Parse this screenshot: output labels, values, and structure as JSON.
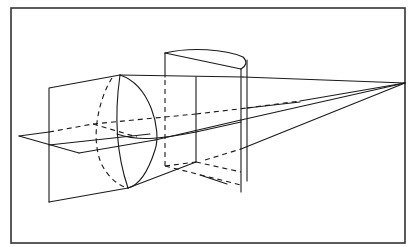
{
  "figure": {
    "colors": {
      "line": "#1a1a1a",
      "frame": "#333333",
      "background": "#ffffff"
    },
    "frame": {
      "x": 11,
      "y": 8,
      "width": 394,
      "height": 235
    },
    "vanishing_point": {
      "x": 405,
      "y": 83
    },
    "elements": [
      {
        "name": "left-vertical-plane",
        "style": "solid"
      },
      {
        "name": "front-ellipse",
        "style": "solid+dashed"
      },
      {
        "name": "horizontal-plane",
        "style": "solid+dashed"
      },
      {
        "name": "rear-cylinder-segment",
        "style": "solid+dashed"
      },
      {
        "name": "projection-lines",
        "style": "solid+dashed"
      }
    ]
  }
}
